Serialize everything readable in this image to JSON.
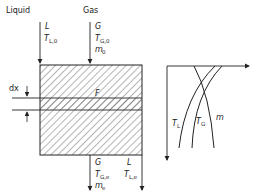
{
  "diagram": {
    "type": "countercurrent-column-schematic",
    "inlet": {
      "liquid": {
        "label": "Liquid",
        "symbol": "L",
        "temp_symbol": "T",
        "temp_sub": "L,0"
      },
      "gas": {
        "label": "Gas",
        "symbol": "G",
        "temp_symbol": "T",
        "temp_sub": "G,0",
        "mass_symbol": "m",
        "mass_sub": "0"
      }
    },
    "column": {
      "area_label": "F",
      "element_label": "dx"
    },
    "outlet": {
      "gas": {
        "symbol": "G",
        "temp_symbol": "T",
        "temp_sub": "G,e",
        "mass_symbol": "m",
        "mass_sub": "e"
      },
      "liquid": {
        "symbol": "L",
        "temp_symbol": "T",
        "temp_sub": "L,e"
      }
    },
    "profiles": {
      "curves": [
        {
          "name": "T",
          "sub": "L"
        },
        {
          "name": "T",
          "sub": "G"
        },
        {
          "name": "m",
          "sub": ""
        }
      ]
    },
    "colors": {
      "line": "#222222",
      "hatch": "#444444",
      "background": "#ffffff"
    }
  }
}
